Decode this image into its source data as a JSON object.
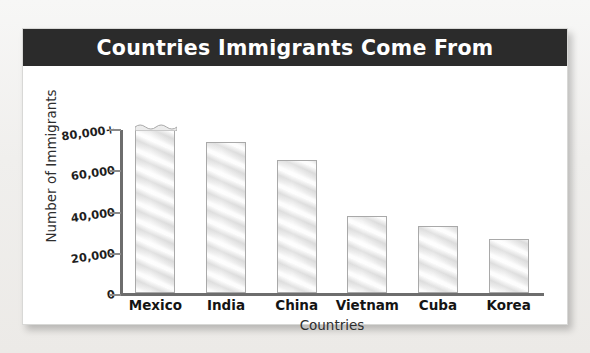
{
  "card": {
    "title": "Countries Immigrants Come From"
  },
  "chart_data": {
    "type": "bar",
    "title": "Countries Immigrants Come From",
    "xlabel": "Countries",
    "ylabel": "Number of Immigrants",
    "categories": [
      "Mexico",
      "India",
      "China",
      "Vietnam",
      "Cuba",
      "Korea"
    ],
    "values": [
      80000,
      73000,
      64500,
      37500,
      32500,
      26000
    ],
    "value_notes": {
      "Mexico": "bar top is drawn with a broken/scalloped edge indicating the value exceeds the axis maximum (80,000+)"
    },
    "ytick_labels": [
      "0",
      "20,000",
      "40,000",
      "60,000",
      "80,000+"
    ],
    "ytick_values": [
      0,
      20000,
      40000,
      60000,
      80000
    ],
    "ylim": [
      0,
      80000
    ],
    "grid": false,
    "legend": null,
    "bar_fill_color": "#e6e6e6",
    "bar_edge_color": "#a9a9a9",
    "title_band_color": "#2b2b2b",
    "title_text_color": "#ffffff"
  }
}
